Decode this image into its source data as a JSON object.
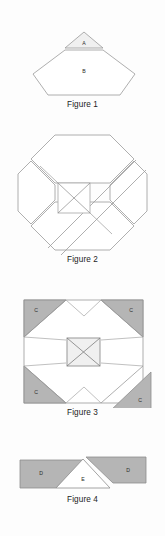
{
  "page": {
    "background_color": "#fdfdfd",
    "width": 165,
    "height": 536
  },
  "palette": {
    "stroke": "#8e8e8e",
    "stroke_dark": "#6f6f6f",
    "shaded_fill": "#b5b5b5",
    "light_fill": "#f0f0f0",
    "white_fill": "#ffffff",
    "label_text": "#2a2a2a",
    "caption_text": "#1c1c1c"
  },
  "figures": [
    {
      "id": "figure-1",
      "caption": "Figure 1",
      "description": "A small triangle labeled A sitting above a wide hexagon labeled B",
      "shapes": [
        {
          "name": "triangle-a",
          "label": "A",
          "fill": "#f0f0f0"
        },
        {
          "name": "hexagon-b",
          "label": "B",
          "fill": "#ffffff"
        }
      ]
    },
    {
      "id": "figure-2",
      "caption": "Figure 2",
      "description": "An octagon split into four flaps around a central square containing an X",
      "shapes": [
        {
          "name": "octagon-outline",
          "label": "",
          "fill": "#ffffff"
        },
        {
          "name": "center-square",
          "label": "",
          "fill": "#ffffff"
        }
      ]
    },
    {
      "id": "figure-3",
      "caption": "Figure 3",
      "description": "A square with four shaded corner triangles each labeled C, an inner octagon, and a central square containing an X",
      "shapes": [
        {
          "name": "corner-triangle-top-left",
          "label": "C",
          "fill": "#b5b5b5"
        },
        {
          "name": "corner-triangle-top-right",
          "label": "C",
          "fill": "#b5b5b5"
        },
        {
          "name": "corner-triangle-bottom-left",
          "label": "C",
          "fill": "#b5b5b5"
        },
        {
          "name": "corner-triangle-bottom-right",
          "label": "C",
          "fill": "#b5b5b5"
        },
        {
          "name": "center-square",
          "label": "",
          "fill": "#f0f0f0"
        }
      ]
    },
    {
      "id": "figure-4",
      "caption": "Figure 4",
      "description": "Two shaded quadrilaterals labeled D flanking a white triangle labeled E",
      "shapes": [
        {
          "name": "quad-d-left",
          "label": "D",
          "fill": "#b5b5b5"
        },
        {
          "name": "triangle-e",
          "label": "E",
          "fill": "#ffffff"
        },
        {
          "name": "quad-d-right",
          "label": "D",
          "fill": "#b5b5b5"
        }
      ]
    }
  ]
}
